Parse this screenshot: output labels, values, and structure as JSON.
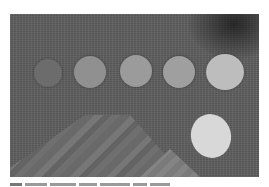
{
  "figure": {
    "background_color": "#5f5f5f",
    "targets": [
      {
        "name": "target-1",
        "cx": 48,
        "cy": 73,
        "r": 14,
        "color": "#6c6c6c"
      },
      {
        "name": "target-2",
        "cx": 90,
        "cy": 72,
        "r": 16,
        "color": "#909090"
      },
      {
        "name": "target-3",
        "cx": 136,
        "cy": 71,
        "r": 16,
        "color": "#9b9b9b"
      },
      {
        "name": "target-4",
        "cx": 179,
        "cy": 72,
        "r": 16,
        "color": "#9f9f9f"
      },
      {
        "name": "target-5",
        "cx": 225,
        "cy": 72,
        "r": 19,
        "color": "#bdbdbd"
      }
    ],
    "ellipse": {
      "color": "#d8d8d8"
    }
  },
  "caption": {
    "text": ""
  }
}
